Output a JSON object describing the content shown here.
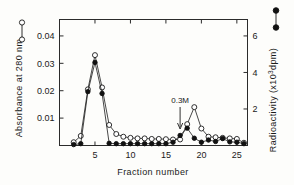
{
  "chart_data": {
    "type": "line",
    "title": "",
    "xlabel": "Fraction  number",
    "ylabel_left": "Absorbance  at  280 nm (o–o)",
    "ylabel_left_text": "Absorbance  at  280 nm",
    "ylabel_left_legend": "(o—o)",
    "ylabel_right": "Radioactivity  (x10³dpm)",
    "ylabel_right_text": "Radioactivity  (x10",
    "ylabel_right_exp": "3",
    "ylabel_right_tail": "dpm)",
    "ylabel_right_legend": "(●—●)",
    "xlim": [
      0,
      26.5
    ],
    "ylim_left": [
      0,
      0.046
    ],
    "ylim_right": [
      0,
      6.9
    ],
    "xticks": [
      5,
      10,
      15,
      20,
      25
    ],
    "xtick_labels": [
      "5",
      "10",
      "15",
      "20",
      "25"
    ],
    "yticks_left": [
      0.01,
      0.02,
      0.03,
      0.04
    ],
    "ytick_labels_left": [
      "0.01",
      "0.02",
      "0.03",
      "0.04"
    ],
    "yticks_right": [
      2,
      4,
      6
    ],
    "ytick_labels_right": [
      "2",
      "4",
      "6"
    ],
    "grid": false,
    "legend_position": "axis-labels",
    "annotations": [
      {
        "text": "0.3M",
        "x": 17,
        "y_axis": "left",
        "arrow": "down",
        "arrow_target_x": 17
      }
    ],
    "series": [
      {
        "name": "Absorbance at 280 nm",
        "marker": "open-circle",
        "axis": "left",
        "x": [
          2,
          3,
          4,
          5,
          6,
          7,
          8,
          9,
          10,
          11,
          12,
          13,
          14,
          15,
          16,
          17,
          18,
          19,
          20,
          21,
          22,
          23,
          24,
          25,
          26
        ],
        "values": [
          0.0012,
          0.0035,
          0.0205,
          0.033,
          0.0212,
          0.0075,
          0.0042,
          0.0032,
          0.0028,
          0.0026,
          0.0026,
          0.0024,
          0.0024,
          0.0023,
          0.0022,
          0.0022,
          0.0078,
          0.014,
          0.0062,
          0.0032,
          0.003,
          0.0028,
          0.0026,
          0.0024,
          0.001
        ]
      },
      {
        "name": "Radioactivity",
        "marker": "closed-circle",
        "axis": "right",
        "x": [
          2,
          3,
          4,
          5,
          6,
          7,
          8,
          9,
          10,
          11,
          12,
          13,
          14,
          15,
          16,
          17,
          18,
          19,
          20,
          21,
          22,
          23,
          24,
          25,
          26
        ],
        "values": [
          0.05,
          0.1,
          2.95,
          4.55,
          2.85,
          0.12,
          0.1,
          0.1,
          0.1,
          0.1,
          0.1,
          0.1,
          0.1,
          0.1,
          0.18,
          0.55,
          0.95,
          0.4,
          0.18,
          0.3,
          0.22,
          0.38,
          0.2,
          0.18,
          0.1
        ]
      }
    ]
  },
  "legend": {
    "right_symbol_name": "filled-circle-legend",
    "left_symbol_name": "open-circle-legend"
  }
}
